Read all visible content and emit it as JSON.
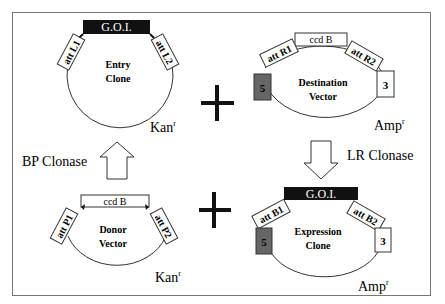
{
  "diagram": {
    "entry_clone": {
      "name_line1": "Entry",
      "name_line2": "Clone",
      "insert": "G.O.I.",
      "att_left": "att L1",
      "att_right": "att L2",
      "resistance": "Kan",
      "resistance_sup": "r"
    },
    "destination_vector": {
      "name_line1": "Destination",
      "name_line2": "Vector",
      "insert": "ccd B",
      "att_left": "att R1",
      "att_right": "att R2",
      "box_left": "5",
      "box_right": "3",
      "resistance": "Amp",
      "resistance_sup": "r"
    },
    "donor_vector": {
      "name_line1": "Donor",
      "name_line2": "Vector",
      "insert": "ccd B",
      "att_left": "att P1",
      "att_right": "att P2",
      "resistance": "Kan",
      "resistance_sup": "r"
    },
    "expression_clone": {
      "name_line1": "Expression",
      "name_line2": "Clone",
      "insert": "G.O.I.",
      "att_left": "att B1",
      "att_right": "att B2",
      "box_left": "5",
      "box_right": "3",
      "resistance": "Amp",
      "resistance_sup": "r"
    },
    "reactions": {
      "bp": "BP Clonase",
      "lr": "LR Clonase"
    },
    "colors": {
      "goi_fill": "#111111",
      "box5_fill": "#666666",
      "frame": "#777777"
    }
  }
}
